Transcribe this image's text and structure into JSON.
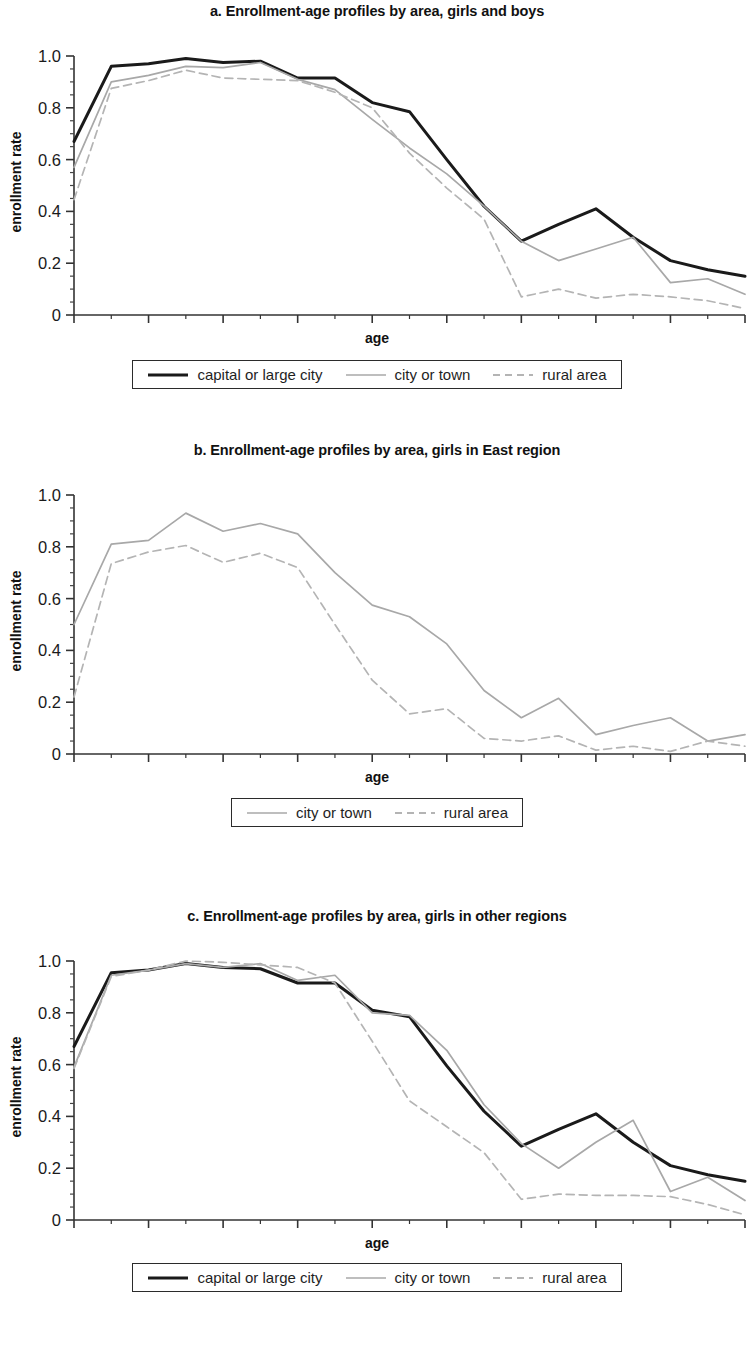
{
  "figure": {
    "axis_label_x": "age",
    "axis_label_y": "enrollment rate",
    "series_labels": {
      "capital": "capital or large city",
      "city": "city or town",
      "rural": "rural area"
    },
    "series_colors": {
      "capital": "#1a1a1a",
      "city": "#a8a8a8",
      "rural": "#b4b4b4"
    },
    "x_ticks": [
      "6",
      "8",
      "10",
      "12",
      "14",
      "16",
      "18",
      "20",
      "22",
      "24"
    ],
    "y_ticks": [
      "1.0",
      "0.8",
      "0.6",
      "0.4",
      "0.2",
      "0"
    ]
  },
  "chart_data": [
    {
      "type": "line",
      "panel": "a",
      "title": "a. Enrollment-age profiles by area, girls and boys",
      "xlabel": "age",
      "ylabel": "enrollment rate",
      "xlim": [
        6,
        24
      ],
      "ylim": [
        0,
        1.0
      ],
      "grid": false,
      "legend_position": "below",
      "x": [
        6,
        7,
        8,
        9,
        10,
        11,
        12,
        13,
        14,
        15,
        16,
        17,
        18,
        19,
        20,
        21,
        22,
        23,
        24
      ],
      "series": [
        {
          "name": "capital or large city",
          "style": "solid",
          "color": "#1a1a1a",
          "values": [
            0.67,
            0.96,
            0.97,
            0.99,
            0.975,
            0.98,
            0.915,
            0.915,
            0.82,
            0.785,
            0.6,
            0.42,
            0.285,
            0.35,
            0.41,
            0.3,
            0.21,
            0.175,
            0.15
          ]
        },
        {
          "name": "city or town",
          "style": "solid",
          "color": "#a8a8a8",
          "values": [
            0.57,
            0.9,
            0.925,
            0.96,
            0.955,
            0.975,
            0.91,
            0.87,
            0.755,
            0.645,
            0.545,
            0.42,
            0.285,
            0.21,
            0.255,
            0.3,
            0.125,
            0.14,
            0.08
          ]
        },
        {
          "name": "rural area",
          "style": "dashed",
          "color": "#b4b4b4",
          "values": [
            0.445,
            0.875,
            0.905,
            0.945,
            0.915,
            0.91,
            0.905,
            0.86,
            0.8,
            0.625,
            0.49,
            0.37,
            0.07,
            0.1,
            0.065,
            0.08,
            0.07,
            0.055,
            0.025
          ]
        }
      ]
    },
    {
      "type": "line",
      "panel": "b",
      "title": "b. Enrollment-age profiles by area, girls in East region",
      "xlabel": "age",
      "ylabel": "enrollment rate",
      "xlim": [
        6,
        24
      ],
      "ylim": [
        0,
        1.0
      ],
      "grid": false,
      "legend_position": "below",
      "x": [
        6,
        7,
        8,
        9,
        10,
        11,
        12,
        13,
        14,
        15,
        16,
        17,
        18,
        19,
        20,
        21,
        22,
        23,
        24
      ],
      "series": [
        {
          "name": "city or town",
          "style": "solid",
          "color": "#a8a8a8",
          "values": [
            0.5,
            0.81,
            0.825,
            0.93,
            0.86,
            0.89,
            0.85,
            0.7,
            0.575,
            0.53,
            0.425,
            0.245,
            0.14,
            0.215,
            0.075,
            0.11,
            0.14,
            0.05,
            0.075
          ]
        },
        {
          "name": "rural area",
          "style": "dashed",
          "color": "#b4b4b4",
          "values": [
            0.22,
            0.735,
            0.78,
            0.805,
            0.74,
            0.775,
            0.72,
            0.5,
            0.285,
            0.155,
            0.175,
            0.06,
            0.05,
            0.07,
            0.015,
            0.03,
            0.01,
            0.05,
            0.03
          ]
        }
      ]
    },
    {
      "type": "line",
      "panel": "c",
      "title": "c. Enrollment-age profiles by area, girls in other regions",
      "xlabel": "age",
      "ylabel": "enrollment rate",
      "xlim": [
        6,
        24
      ],
      "ylim": [
        0,
        1.0
      ],
      "grid": false,
      "legend_position": "below",
      "x": [
        6,
        7,
        8,
        9,
        10,
        11,
        12,
        13,
        14,
        15,
        16,
        17,
        18,
        19,
        20,
        21,
        22,
        23,
        24
      ],
      "series": [
        {
          "name": "capital or large city",
          "style": "solid",
          "color": "#1a1a1a",
          "values": [
            0.67,
            0.955,
            0.965,
            0.99,
            0.975,
            0.97,
            0.915,
            0.915,
            0.81,
            0.785,
            0.595,
            0.42,
            0.285,
            0.35,
            0.41,
            0.3,
            0.21,
            0.175,
            0.15
          ]
        },
        {
          "name": "city or town",
          "style": "solid",
          "color": "#a8a8a8",
          "values": [
            0.59,
            0.945,
            0.965,
            0.99,
            0.975,
            0.99,
            0.925,
            0.945,
            0.8,
            0.79,
            0.655,
            0.445,
            0.295,
            0.2,
            0.3,
            0.385,
            0.11,
            0.165,
            0.075
          ]
        },
        {
          "name": "rural area",
          "style": "dashed",
          "color": "#b4b4b4",
          "values": [
            0.585,
            0.94,
            0.965,
            1.0,
            0.995,
            0.985,
            0.975,
            0.915,
            0.69,
            0.46,
            0.36,
            0.26,
            0.08,
            0.1,
            0.095,
            0.095,
            0.09,
            0.06,
            0.02
          ]
        }
      ]
    }
  ]
}
